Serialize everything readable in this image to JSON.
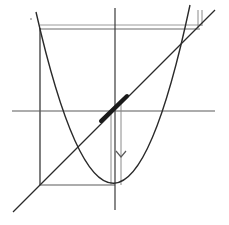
{
  "diagram": {
    "colors": {
      "background": "#ffffff",
      "curve": "#2a2a2a",
      "axis": "#3a3a3a",
      "guide": "#8a8a8a",
      "highlight": "#1a1a1a"
    },
    "elements": [
      {
        "name": "y-axis",
        "kind": "axis"
      },
      {
        "name": "x-axis",
        "kind": "axis"
      },
      {
        "name": "parabola",
        "kind": "curve"
      },
      {
        "name": "diagonal-line",
        "kind": "line"
      },
      {
        "name": "thick-segment",
        "kind": "highlight"
      },
      {
        "name": "down-arrow",
        "kind": "arrow"
      }
    ],
    "labels": []
  }
}
